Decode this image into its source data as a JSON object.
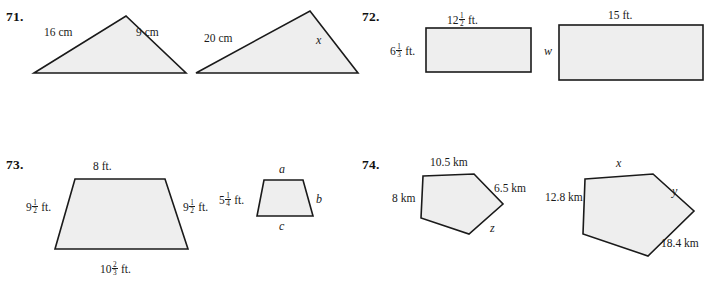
{
  "page": {
    "width": 717,
    "height": 287,
    "background": "#ffffff",
    "ink": "#1a1a1a",
    "shape_fill": "#eeeeee"
  },
  "problems": [
    {
      "number": "71.",
      "figures": [
        {
          "name": "triangle-small-71",
          "labels": [
            {
              "name": "label-16-cm",
              "text": "16 cm"
            },
            {
              "name": "label-9-cm",
              "text": "9 cm"
            }
          ]
        },
        {
          "name": "triangle-large-71",
          "labels": [
            {
              "name": "label-20-cm",
              "text": "20 cm"
            },
            {
              "name": "label-x",
              "text": "x"
            }
          ]
        }
      ]
    },
    {
      "number": "72.",
      "figures": [
        {
          "name": "rectangle-small-72",
          "labels": [
            {
              "name": "label-12-and-one-half-ft",
              "whole": "12",
              "num": "1",
              "den": "2",
              "unit": "ft."
            },
            {
              "name": "label-6-and-one-third-ft",
              "whole": "6",
              "num": "1",
              "den": "3",
              "unit": "ft."
            }
          ]
        },
        {
          "name": "rectangle-large-72",
          "labels": [
            {
              "name": "label-15-ft",
              "text": "15 ft."
            },
            {
              "name": "label-w",
              "text": "w"
            }
          ]
        }
      ]
    },
    {
      "number": "73.",
      "figures": [
        {
          "name": "trapezoid-large-73",
          "labels": [
            {
              "name": "label-8-ft",
              "text": "8 ft."
            },
            {
              "name": "label-9-and-one-half-ft-left",
              "whole": "9",
              "num": "1",
              "den": "2",
              "unit": "ft."
            },
            {
              "name": "label-9-and-one-half-ft-right",
              "whole": "9",
              "num": "1",
              "den": "2",
              "unit": "ft."
            },
            {
              "name": "label-10-and-two-thirds-ft",
              "whole": "10",
              "num": "2",
              "den": "3",
              "unit": "ft."
            }
          ]
        },
        {
          "name": "trapezoid-small-73",
          "labels": [
            {
              "name": "label-a",
              "text": "a"
            },
            {
              "name": "label-b",
              "text": "b"
            },
            {
              "name": "label-c",
              "text": "c"
            },
            {
              "name": "label-5-and-one-quarter-ft",
              "whole": "5",
              "num": "1",
              "den": "4",
              "unit": "ft."
            }
          ]
        }
      ]
    },
    {
      "number": "74.",
      "figures": [
        {
          "name": "pentagon-small-74",
          "labels": [
            {
              "name": "label-10-5-km",
              "text": "10.5 km"
            },
            {
              "name": "label-6-5-km",
              "text": "6.5 km"
            },
            {
              "name": "label-8-km",
              "text": "8 km"
            },
            {
              "name": "label-z",
              "text": "z"
            }
          ]
        },
        {
          "name": "pentagon-large-74",
          "labels": [
            {
              "name": "label-x",
              "text": "x"
            },
            {
              "name": "label-y",
              "text": "y"
            },
            {
              "name": "label-12-8-km",
              "text": "12.8 km"
            },
            {
              "name": "label-18-4-km",
              "text": "18.4 km"
            }
          ]
        }
      ]
    }
  ]
}
